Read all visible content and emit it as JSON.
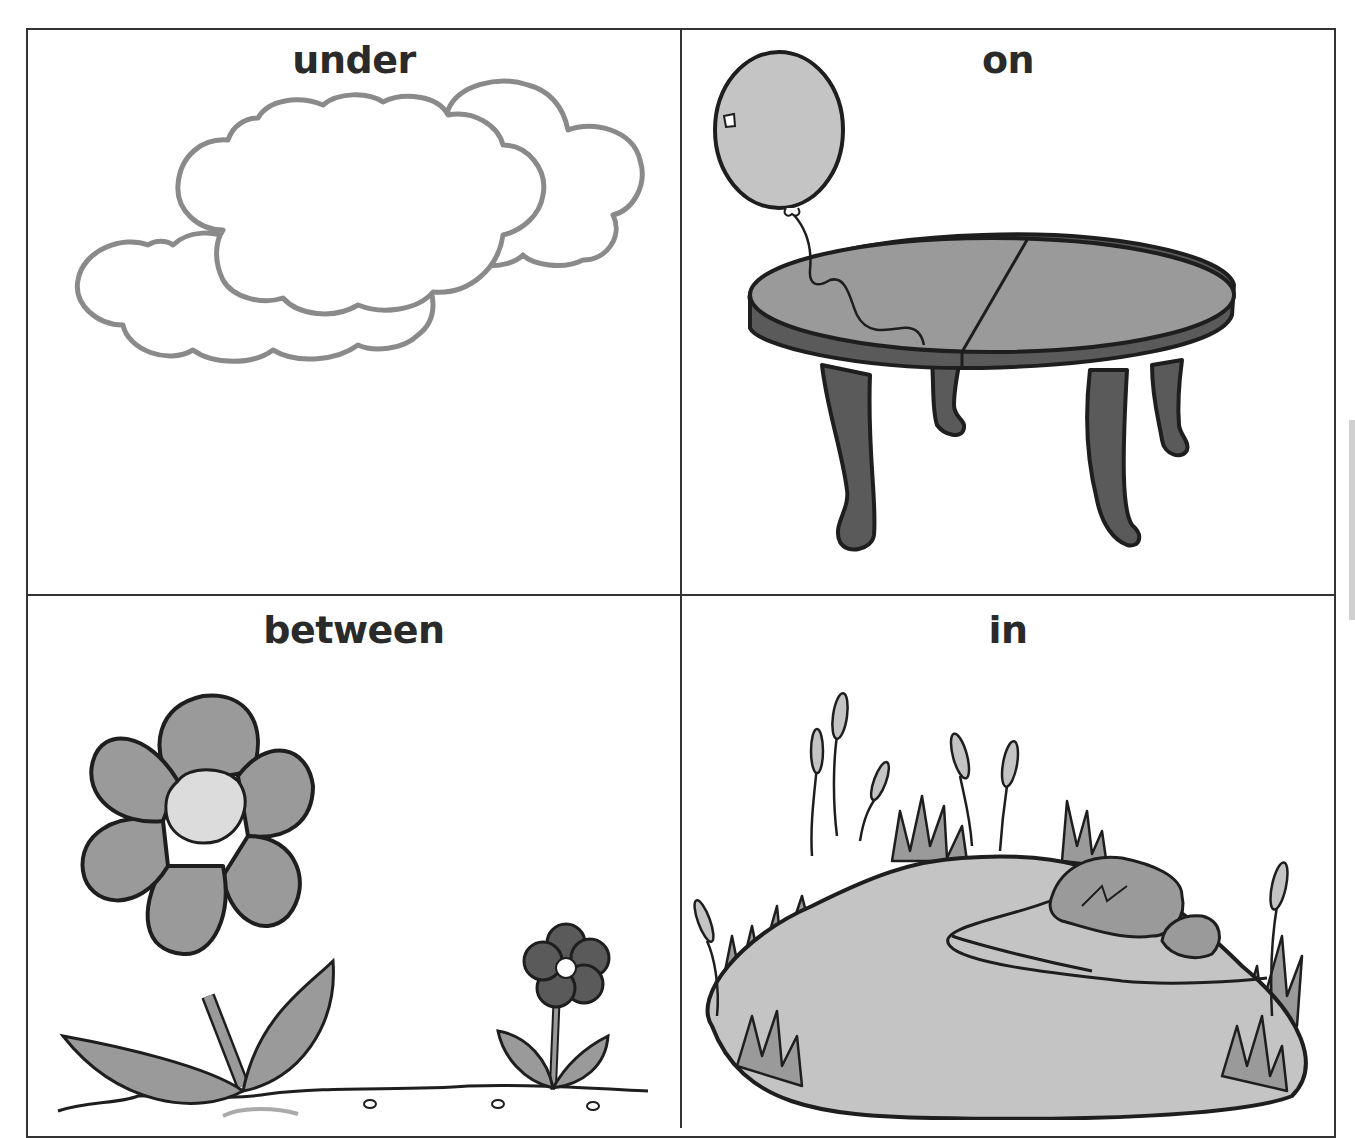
{
  "worksheet": {
    "cells": [
      {
        "word": "under",
        "picture": "clouds"
      },
      {
        "word": "on",
        "picture": "balloon-and-table"
      },
      {
        "word": "between",
        "picture": "two-flowers"
      },
      {
        "word": "in",
        "picture": "pond-with-cattails"
      }
    ]
  },
  "colors": {
    "border": "#333333",
    "text": "#2a2a2a",
    "cloud_outline": "#8a8a8a",
    "light_fill": "#c4c4c4",
    "mid_fill": "#9a9a9a",
    "dark_fill": "#5a5a5a",
    "outline": "#1e1e1e"
  }
}
